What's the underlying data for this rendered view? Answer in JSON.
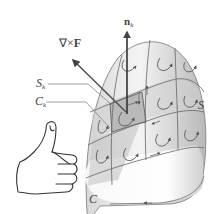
{
  "diagram": {
    "type": "stokes-theorem-illustration",
    "labels": {
      "curl": {
        "prefix": "∇×",
        "vector": "F"
      },
      "normal": {
        "vector": "n",
        "subscript": "k"
      },
      "patch_surface": {
        "symbol": "S",
        "subscript": "k"
      },
      "patch_curve": {
        "symbol": "C",
        "subscript": "k"
      },
      "surface": "S",
      "boundary": "C"
    },
    "elements": [
      "dome-shaped surface S with grid patches",
      "highlighted patch S_k bounded by curve C_k",
      "normal vector n_k pointing up",
      "curl vector ∇×F pointing up-left",
      "circulation arrows on each patch",
      "boundary curve C with direction arrow",
      "right-hand thumbs-up illustrating orientation"
    ],
    "colors": {
      "surface_light": "#f2f2f2",
      "surface_dark": "#bdbdbd",
      "patch_highlight": "#c8c8c8",
      "line": "#555555",
      "arrow": "#444444"
    }
  }
}
